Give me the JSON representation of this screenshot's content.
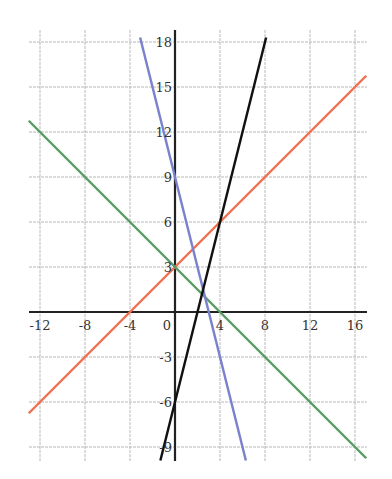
{
  "chart_data": {
    "type": "line",
    "title": "",
    "xlabel": "",
    "ylabel": "",
    "xlim": [
      -13,
      17
    ],
    "ylim": [
      -9.9,
      18.4
    ],
    "grid": true,
    "x_ticks": [
      -12,
      -8,
      -4,
      0,
      4,
      8,
      12,
      16
    ],
    "y_ticks": [
      -9,
      -6,
      -3,
      3,
      6,
      9,
      12,
      15,
      18
    ],
    "x_tick_labels": [
      "-12",
      "-8",
      "-4",
      "0",
      "4",
      "8",
      "12",
      "16"
    ],
    "y_tick_labels": [
      "-9",
      "-6",
      "-3",
      "3",
      "6",
      "9",
      "12",
      "15",
      "18"
    ],
    "series": [
      {
        "name": "orange line",
        "equation": "y = 0.75x + 3",
        "slope": 0.75,
        "intercept": 3,
        "color": "#f07050",
        "x": [
          -13,
          17
        ],
        "y": [
          -6.75,
          15.75
        ]
      },
      {
        "name": "green line",
        "equation": "y = -0.75x + 3",
        "slope": -0.75,
        "intercept": 3,
        "color": "#5a9a64",
        "x": [
          -13,
          17
        ],
        "y": [
          12.75,
          -9.75
        ]
      },
      {
        "name": "blue line",
        "equation": "y = -3x + 9",
        "slope": -3,
        "intercept": 9,
        "color": "#7a82cc",
        "x": [
          -3.1,
          6.3
        ],
        "y": [
          18.3,
          -9.9
        ]
      },
      {
        "name": "black line",
        "equation": "y = 3x - 6",
        "slope": 3,
        "intercept": -6,
        "color": "#111111",
        "x": [
          -1.3,
          8.1
        ],
        "y": [
          -9.9,
          18.3
        ]
      }
    ],
    "legend": "none"
  },
  "layout": {
    "px_origin_x": 175,
    "px_origin_y": 312,
    "px_per_x_unit": 11.25,
    "px_per_y_unit": 15,
    "axis_color": "#222222",
    "grid_color": "#b8b8b8"
  }
}
